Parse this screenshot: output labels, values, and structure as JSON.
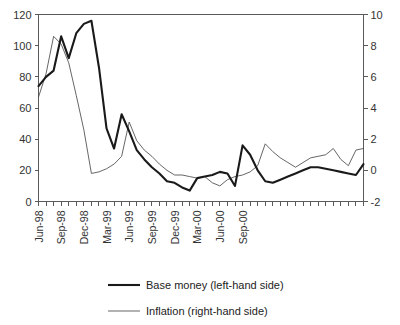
{
  "chart_data": {
    "type": "line",
    "title": "",
    "xlabel": "",
    "ylabel": "",
    "grid": false,
    "legend_position": "bottom",
    "x_tick_labels": [
      "Jun-98",
      "Sep-98",
      "Dec-98",
      "Mar-99",
      "Jun-99",
      "Sep-99",
      "Dec-99",
      "Mar-00",
      "Jun-00",
      "Sep-00"
    ],
    "x_tick_label_indices": [
      0,
      3,
      6,
      9,
      12,
      15,
      18,
      21,
      24,
      27
    ],
    "x_months": [
      "Jun-98",
      "Jul-98",
      "Aug-98",
      "Sep-98",
      "Oct-98",
      "Nov-98",
      "Dec-98",
      "Jan-99",
      "Feb-99",
      "Mar-99",
      "Apr-99",
      "May-99",
      "Jun-99",
      "Jul-99",
      "Aug-99",
      "Sep-99",
      "Oct-99",
      "Nov-99",
      "Dec-99",
      "Jan-00",
      "Feb-00",
      "Mar-00",
      "Apr-00",
      "May-00",
      "Jun-00",
      "Jul-00",
      "Aug-00",
      "Sep-00",
      "Oct-00",
      "Nov-00"
    ],
    "axes": {
      "left": {
        "label": "Base money (left-hand side)",
        "ticks": [
          0,
          20,
          40,
          60,
          80,
          100,
          120
        ],
        "ylim": [
          0,
          120
        ]
      },
      "right": {
        "label": "Inflation (right-hand side)",
        "ticks": [
          -2,
          0,
          2,
          4,
          6,
          8,
          10
        ],
        "ylim": [
          -2,
          10
        ]
      }
    },
    "series": [
      {
        "name": "Base money (left-hand side)",
        "axis": "left",
        "style": "thick",
        "color": "#1a1a1a",
        "values": [
          74,
          80,
          84,
          106,
          92,
          108,
          114,
          116,
          86,
          47,
          34,
          56,
          45,
          33,
          27,
          22,
          18,
          13,
          12,
          9,
          7,
          15,
          16,
          17,
          19,
          18,
          10,
          36,
          30,
          20,
          13,
          12,
          14,
          16,
          18,
          20,
          22,
          22,
          21,
          20,
          19,
          18,
          17,
          24
        ]
      },
      {
        "name": "Inflation (right-hand side)",
        "axis": "right",
        "style": "thin",
        "color": "#4a4a4a",
        "values": [
          4.7,
          6.2,
          8.6,
          8.1,
          6.9,
          4.8,
          2.6,
          -0.2,
          -0.1,
          0.1,
          0.4,
          0.9,
          3.1,
          1.9,
          1.3,
          0.9,
          0.4,
          0.0,
          -0.3,
          -0.3,
          -0.4,
          -0.5,
          -0.4,
          -0.8,
          -1.0,
          -0.6,
          -0.4,
          -0.3,
          -0.1,
          0.3,
          1.7,
          1.2,
          0.8,
          0.5,
          0.2,
          0.5,
          0.8,
          0.9,
          1.0,
          1.4,
          0.7,
          0.3,
          1.3,
          1.4
        ]
      }
    ]
  },
  "legend": {
    "items": [
      {
        "label": "Base money (left-hand side)",
        "style": "thick"
      },
      {
        "label": "Inflation  (right-hand side)",
        "style": "thin"
      }
    ]
  }
}
